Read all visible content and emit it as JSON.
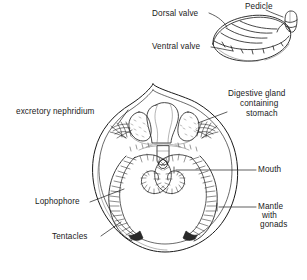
{
  "figure": {
    "background_color": "#ffffff",
    "ink_color": "#1a1a1a",
    "shading_color": "#6b6b6b"
  },
  "shell_view": {
    "name": "external shell view",
    "labels": [
      {
        "id": "dorsal-valve",
        "text": "Dorsal valve",
        "x": 152,
        "y": 9,
        "align": "left"
      },
      {
        "id": "pedicle",
        "text": "Pedicle",
        "x": 245,
        "y": 2,
        "align": "left"
      },
      {
        "id": "ventral-valve",
        "text": "Ventral valve",
        "x": 152,
        "y": 42,
        "align": "left"
      }
    ]
  },
  "section_view": {
    "name": "internal section view",
    "labels": [
      {
        "id": "excretory-nephridium",
        "text": "excretory nephridium",
        "x": 16,
        "y": 107,
        "align": "left"
      },
      {
        "id": "digestive-gland",
        "text": "Digestive gland",
        "x": 228,
        "y": 89,
        "align": "left"
      },
      {
        "id": "containing",
        "text": "containing",
        "x": 240,
        "y": 99,
        "align": "left"
      },
      {
        "id": "stomach",
        "text": "stomach",
        "x": 246,
        "y": 109,
        "align": "left"
      },
      {
        "id": "mouth",
        "text": "Mouth",
        "x": 258,
        "y": 168,
        "align": "left"
      },
      {
        "id": "mantle",
        "text": "Mantle",
        "x": 258,
        "y": 204,
        "align": "left"
      },
      {
        "id": "with",
        "text": "with",
        "x": 262,
        "y": 213,
        "align": "left"
      },
      {
        "id": "gonads",
        "text": "gonads",
        "x": 260,
        "y": 222,
        "align": "left"
      },
      {
        "id": "lophophore",
        "text": "Lophophore",
        "x": 35,
        "y": 199,
        "align": "left"
      },
      {
        "id": "tentacles",
        "text": "Tentacles",
        "x": 52,
        "y": 234,
        "align": "left"
      }
    ]
  }
}
